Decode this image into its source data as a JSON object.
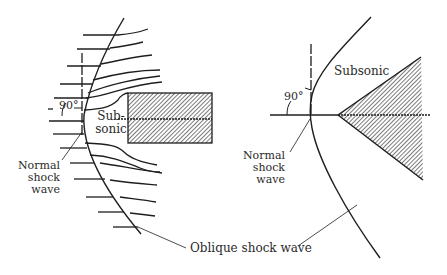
{
  "figure": {
    "left_panel": {
      "name": "blunt-body-flow",
      "labels": {
        "angle": "90°",
        "subsonic_line1": "Sub-",
        "subsonic_line2": "sonic",
        "normal_shock_line1": "Normal",
        "normal_shock_line2": "shock",
        "normal_shock_line3": "wave"
      }
    },
    "right_panel": {
      "name": "wedge-flow",
      "labels": {
        "angle": "90°",
        "subsonic": "Subsonic",
        "normal_shock_line1": "Normal",
        "normal_shock_line2": "shock",
        "normal_shock_line3": "wave"
      }
    },
    "shared_label": "Oblique shock wave",
    "colors": {
      "ink": "#1e1e1e",
      "hatch": "#333333",
      "text": "#2a2a2a",
      "background": "#ffffff"
    }
  }
}
